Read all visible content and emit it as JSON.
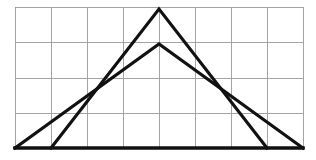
{
  "figure": {
    "title": "Two overlapping triangles on a rectangular grid",
    "background_color": "#ffffff",
    "grid_color": "#9a9a9a",
    "stroke_color": "#111111"
  },
  "chart_data": {
    "type": "line",
    "title": "Two overlapping triangles on a rectangular grid",
    "subtitle": "",
    "xlabel": "",
    "ylabel": "",
    "grid": true,
    "legend_position": "none",
    "xlim": [
      0,
      8
    ],
    "ylim": [
      0,
      4
    ],
    "x_tick_labels": [],
    "y_tick_labels": [],
    "grid_spec": {
      "columns": 8,
      "rows": 4,
      "x_gridlines_px": [
        15,
        51,
        87,
        123,
        159,
        195,
        231,
        267,
        303
      ],
      "y_gridlines_px": [
        7,
        42,
        78,
        113,
        148
      ],
      "left_px": 15,
      "right_px": 303,
      "top_px": 7,
      "bottom_px": 148,
      "cell_width_px": 36,
      "cell_height_px": 35.25
    },
    "series": [
      {
        "name": "tall-triangle",
        "description": "Tall narrow triangle, apex at grid center top, base from gridline 1 to gridline 7",
        "points_px": [
          [
            51,
            148
          ],
          [
            159,
            9
          ],
          [
            267,
            148
          ]
        ],
        "points_grid": [
          [
            1,
            0
          ],
          [
            4,
            4
          ],
          [
            7,
            0
          ]
        ],
        "closed": false
      },
      {
        "name": "wide-triangle",
        "description": "Wide flatter triangle, apex one row lower, base spanning full grid width",
        "points_px": [
          [
            15,
            148
          ],
          [
            159,
            44
          ],
          [
            303,
            148
          ]
        ],
        "points_grid": [
          [
            0,
            0
          ],
          [
            4,
            3
          ],
          [
            8,
            0
          ]
        ],
        "closed": false
      },
      {
        "name": "baseline",
        "description": "Shared horizontal base along the bottom grid line",
        "points_px": [
          [
            15,
            148
          ],
          [
            303,
            148
          ]
        ],
        "points_grid": [
          [
            0,
            0
          ],
          [
            8,
            0
          ]
        ],
        "closed": false
      }
    ],
    "annotations": [
      {
        "name": "left-crossing",
        "label": "",
        "x_px": 95,
        "y_px": 88
      },
      {
        "name": "right-crossing",
        "label": "",
        "x_px": 224,
        "y_px": 88
      }
    ]
  }
}
